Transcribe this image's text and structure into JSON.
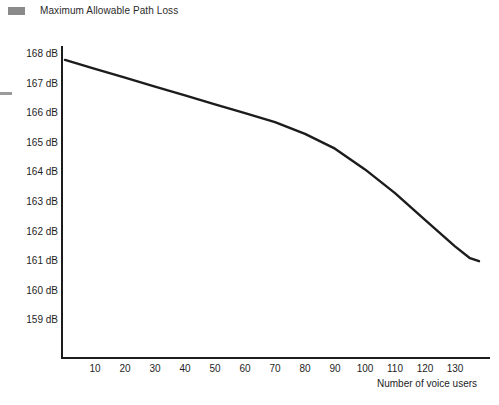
{
  "header": {
    "legend_label": "Maximum Allowable Path Loss",
    "legend_swatch_color": "#8a8a8a"
  },
  "axes": {
    "y_unit": "dB",
    "y_tick_labels": [
      "168 dB",
      "167 dB",
      "166 dB",
      "165 dB",
      "164 dB",
      "163 dB",
      "162 dB",
      "161 dB",
      "160 dB",
      "159 dB"
    ],
    "x_tick_labels": [
      "10",
      "20",
      "30",
      "40",
      "50",
      "60",
      "70",
      "80",
      "90",
      "100",
      "110",
      "120",
      "130"
    ],
    "x_axis_title": "Number of voice users",
    "y_axis_title": ""
  },
  "chart_data": {
    "type": "line",
    "title": "Maximum Allowable Path Loss",
    "xlabel": "Number of voice users",
    "ylabel": "Maximum Allowable Path Loss (dB)",
    "xlim": [
      0,
      143
    ],
    "ylim": [
      158.5,
      168.5
    ],
    "grid": false,
    "legend_position": "top-left",
    "line_color": "#1c1c1c",
    "line_width": 2.4,
    "series": [
      {
        "name": "Maximum Allowable Path Loss",
        "units": "dB",
        "x": [
          0,
          10,
          20,
          30,
          40,
          50,
          60,
          70,
          80,
          90,
          100,
          110,
          120,
          130,
          135,
          138
        ],
        "values": [
          167.8,
          167.5,
          167.2,
          166.9,
          166.6,
          166.3,
          166.0,
          165.7,
          165.3,
          164.8,
          164.1,
          163.3,
          162.4,
          161.5,
          161.1,
          161.0
        ]
      }
    ]
  }
}
